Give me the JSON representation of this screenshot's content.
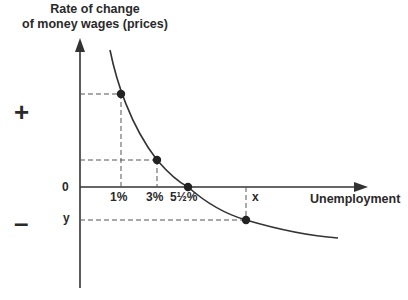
{
  "diagram": {
    "title_line1": "Rate of change",
    "title_line2": "of money wages (prices)",
    "x_axis_label": "Unemployment",
    "sign_positive": "+",
    "sign_negative": "–",
    "y_zero_label": "0",
    "y_marker_label": "y",
    "x_marker_label": "x",
    "x_tick_labels": [
      "1%",
      "3%",
      "5½%"
    ],
    "curve_type": "Phillips curve",
    "points": [
      {
        "x_label": "1%",
        "y": "high positive"
      },
      {
        "x_label": "3%",
        "y": "low positive"
      },
      {
        "x_label": "5½%",
        "y": "0"
      },
      {
        "x_label": "x",
        "y": "y (negative)"
      }
    ]
  }
}
